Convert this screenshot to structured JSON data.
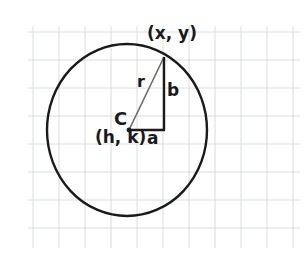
{
  "figure": {
    "kind": "geometry-diagram",
    "background_color": "#ffffff",
    "grid": {
      "visible": true,
      "line_color": "#d8dce0",
      "cell_width": 26,
      "cell_height": 28,
      "left": 33,
      "top": 32,
      "right": 295,
      "bottom": 240,
      "vertical_lines": [
        33,
        59,
        85,
        111,
        137,
        163,
        189,
        215,
        241,
        267,
        293
      ],
      "horizontal_lines": [
        32,
        60,
        88,
        116,
        144,
        172,
        200,
        228
      ]
    },
    "circle": {
      "stroke_color": "#1a1a1a",
      "stroke_width": 2.4,
      "fill": "none",
      "center_x": 127,
      "center_y": 130,
      "radius_x": 80,
      "radius_y": 86
    },
    "center_point": {
      "x": 129,
      "y": 130,
      "color": "#1a1a1a",
      "radius": 2.4
    },
    "triangle": {
      "vertex_center_x": 129,
      "vertex_center_y": 130,
      "vertex_corner_x": 164,
      "vertex_corner_y": 130,
      "vertex_point_x": 164,
      "vertex_point_y": 57,
      "leg_a_color": "#1a1a1a",
      "leg_a_width": 2.4,
      "leg_b_color": "#1a1a1a",
      "leg_b_width": 2.4,
      "hypotenuse_color": "#6b6b6b",
      "hypotenuse_width": 1.6
    },
    "labels": {
      "point_on_circle": "(x, y)",
      "radius": "r",
      "vertical_leg": "b",
      "center_letter": "C",
      "center_coords": "(h, k)",
      "horizontal_leg": "a"
    }
  }
}
